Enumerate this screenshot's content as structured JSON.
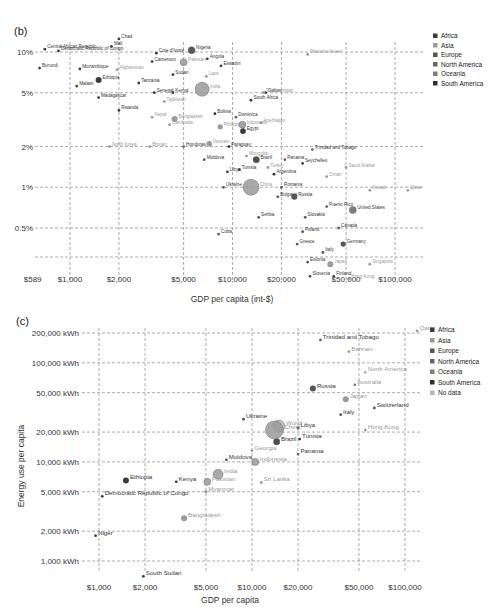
{
  "chart_data": [
    {
      "id": "b",
      "type": "scatter",
      "panel_label": "(b)",
      "title": "",
      "xlabel": "GDP per capita (int-$)",
      "ylabel": "",
      "x_scale": "log",
      "y_scale": "log",
      "x_ticks": [
        "$589",
        "$1,000",
        "$2,000",
        "$5,000",
        "$10,000",
        "$20,000",
        "$50,000",
        "$100,000"
      ],
      "y_ticks": [
        "10%",
        "5%",
        "2%",
        "1%",
        "0.5%"
      ],
      "xlim": [
        589,
        150000
      ],
      "ylim": [
        0.25,
        13
      ],
      "grid": true,
      "legend_position": "right",
      "legend": [
        "Africa",
        "Asia",
        "Europe",
        "North America",
        "Oceania",
        "South America"
      ],
      "points": [
        {
          "label": "Central African Republic",
          "gdp": 700,
          "value": 10.5,
          "region": "Africa"
        },
        {
          "label": "Democratic Republic of Congo",
          "gdp": 850,
          "value": 10.2,
          "region": "Africa"
        },
        {
          "label": "Mali",
          "gdp": 1800,
          "value": 11.0,
          "region": "Africa"
        },
        {
          "label": "Chad",
          "gdp": 2000,
          "value": 12.5,
          "region": "Africa"
        },
        {
          "label": "Cote d'Ivoire",
          "gdp": 3400,
          "value": 9.8,
          "region": "Africa"
        },
        {
          "label": "Nigeria",
          "gdp": 5600,
          "value": 10.3,
          "region": "Africa"
        },
        {
          "label": "Burundi",
          "gdp": 650,
          "value": 7.6,
          "region": "Africa"
        },
        {
          "label": "Mozambique",
          "gdp": 1150,
          "value": 7.5,
          "region": "Africa"
        },
        {
          "label": "Afghanistan",
          "gdp": 1950,
          "value": 7.4,
          "region": "Asia"
        },
        {
          "label": "Cameroon",
          "gdp": 3200,
          "value": 8.5,
          "region": "Africa"
        },
        {
          "label": "Pakistan",
          "gdp": 5000,
          "value": 8.4,
          "region": "Asia"
        },
        {
          "label": "Angola",
          "gdp": 7000,
          "value": 8.9,
          "region": "Africa"
        },
        {
          "label": "Eswatini",
          "gdp": 8500,
          "value": 7.9,
          "region": "Africa"
        },
        {
          "label": "Sudan",
          "gdp": 4300,
          "value": 6.8,
          "region": "Africa"
        },
        {
          "label": "Laos",
          "gdp": 6900,
          "value": 6.6,
          "region": "Asia"
        },
        {
          "label": "Malawi",
          "gdp": 1100,
          "value": 5.6,
          "region": "Africa"
        },
        {
          "label": "Ethiopia",
          "gdp": 1500,
          "value": 6.2,
          "region": "Africa"
        },
        {
          "label": "Tanzania",
          "gdp": 2650,
          "value": 5.9,
          "region": "Africa"
        },
        {
          "label": "India",
          "gdp": 6500,
          "value": 5.3,
          "region": "Asia"
        },
        {
          "label": "Madagascar",
          "gdp": 1500,
          "value": 4.6,
          "region": "Africa"
        },
        {
          "label": "Senegal",
          "gdp": 3300,
          "value": 5.0,
          "region": "Africa"
        },
        {
          "label": "Kenya",
          "gdp": 4300,
          "value": 5.0,
          "region": "Africa"
        },
        {
          "label": "Tajikistan",
          "gdp": 3800,
          "value": 4.3,
          "region": "Asia"
        },
        {
          "label": "Bolivia",
          "gdp": 7800,
          "value": 3.5,
          "region": "South America"
        },
        {
          "label": "South Africa",
          "gdp": 13000,
          "value": 4.4,
          "region": "Africa"
        },
        {
          "label": "Gabon",
          "gdp": 16000,
          "value": 5.0,
          "region": "Africa"
        },
        {
          "label": "Turkmenistan",
          "gdp": 15500,
          "value": 5.0,
          "region": "Asia"
        },
        {
          "label": "Palestine/Israel",
          "gdp": 29000,
          "value": 9.6,
          "region": "Asia"
        },
        {
          "label": "Rwanda",
          "gdp": 2000,
          "value": 3.7,
          "region": "Africa"
        },
        {
          "label": "Nepal",
          "gdp": 3200,
          "value": 3.3,
          "region": "Asia"
        },
        {
          "label": "Bangladesh",
          "gdp": 4400,
          "value": 3.2,
          "region": "Asia"
        },
        {
          "label": "Cambodia",
          "gdp": 4100,
          "value": 2.9,
          "region": "Asia"
        },
        {
          "label": "Dominica",
          "gdp": 10500,
          "value": 3.3,
          "region": "North America"
        },
        {
          "label": "Philippines",
          "gdp": 8400,
          "value": 2.8,
          "region": "Asia"
        },
        {
          "label": "Indonesia",
          "gdp": 11500,
          "value": 2.9,
          "region": "Asia"
        },
        {
          "label": "Azerbaijan",
          "gdp": 15000,
          "value": 3.0,
          "region": "Asia"
        },
        {
          "label": "Egypt",
          "gdp": 11600,
          "value": 2.6,
          "region": "Africa"
        },
        {
          "label": "Vietnam",
          "gdp": 7200,
          "value": 2.1,
          "region": "Asia"
        },
        {
          "label": "North Korea",
          "gdp": 1750,
          "value": 2.0,
          "region": "Asia"
        },
        {
          "label": "Bhutan",
          "gdp": 3100,
          "value": 2.0,
          "region": "Asia"
        },
        {
          "label": "Honduras",
          "gdp": 5000,
          "value": 2.0,
          "region": "North America"
        },
        {
          "label": "Paraguay",
          "gdp": 9500,
          "value": 2.0,
          "region": "South America"
        },
        {
          "label": "Mongolia",
          "gdp": 12200,
          "value": 1.7,
          "region": "Asia"
        },
        {
          "label": "Moldova",
          "gdp": 6700,
          "value": 1.6,
          "region": "Europe"
        },
        {
          "label": "Brazil",
          "gdp": 14000,
          "value": 1.6,
          "region": "South America"
        },
        {
          "label": "Panama",
          "gdp": 21000,
          "value": 1.6,
          "region": "North America"
        },
        {
          "label": "Trinidad and Tobago",
          "gdp": 31000,
          "value": 1.9,
          "region": "North America"
        },
        {
          "label": "Seychelles",
          "gdp": 27000,
          "value": 1.5,
          "region": "Africa"
        },
        {
          "label": "Saudi Arabia",
          "gdp": 50000,
          "value": 1.4,
          "region": "Asia"
        },
        {
          "label": "Libya",
          "gdp": 9300,
          "value": 1.3,
          "region": "Africa"
        },
        {
          "label": "Tunisia",
          "gdp": 11000,
          "value": 1.35,
          "region": "Africa"
        },
        {
          "label": "Turkey",
          "gdp": 16500,
          "value": 1.4,
          "region": "Asia"
        },
        {
          "label": "China",
          "gdp": 13000,
          "value": 1.0,
          "region": "Asia"
        },
        {
          "label": "Argentina",
          "gdp": 18000,
          "value": 1.25,
          "region": "South America"
        },
        {
          "label": "Oman",
          "gdp": 38000,
          "value": 1.2,
          "region": "Asia"
        },
        {
          "label": "Ukraine",
          "gdp": 8800,
          "value": 1.0,
          "region": "Europe"
        },
        {
          "label": "Romania",
          "gdp": 20000,
          "value": 1.0,
          "region": "Europe"
        },
        {
          "label": "Kuwait",
          "gdp": 70000,
          "value": 0.95,
          "region": "Asia"
        },
        {
          "label": "Qatar",
          "gdp": 120000,
          "value": 0.95,
          "region": "Asia"
        },
        {
          "label": "Bulgaria",
          "gdp": 19000,
          "value": 0.85,
          "region": "Europe"
        },
        {
          "label": "Russia",
          "gdp": 24000,
          "value": 0.85,
          "region": "Europe"
        },
        {
          "label": "Puerto Rico",
          "gdp": 38000,
          "value": 0.72,
          "region": "North America"
        },
        {
          "label": "United States",
          "gdp": 55000,
          "value": 0.68,
          "region": "North America"
        },
        {
          "label": "Serbia",
          "gdp": 14500,
          "value": 0.6,
          "region": "Europe"
        },
        {
          "label": "Slovakia",
          "gdp": 28000,
          "value": 0.6,
          "region": "Europe"
        },
        {
          "label": "Cuba",
          "gdp": 8200,
          "value": 0.45,
          "region": "North America"
        },
        {
          "label": "Canada",
          "gdp": 45000,
          "value": 0.5,
          "region": "North America"
        },
        {
          "label": "Poland",
          "gdp": 27000,
          "value": 0.47,
          "region": "Europe"
        },
        {
          "label": "Greece",
          "gdp": 25000,
          "value": 0.38,
          "region": "Europe"
        },
        {
          "label": "Germany",
          "gdp": 48000,
          "value": 0.38,
          "region": "Europe"
        },
        {
          "label": "Italy",
          "gdp": 36000,
          "value": 0.33,
          "region": "Europe"
        },
        {
          "label": "Estonia",
          "gdp": 29000,
          "value": 0.28,
          "region": "Europe"
        },
        {
          "label": "Japan",
          "gdp": 40000,
          "value": 0.27,
          "region": "Asia"
        },
        {
          "label": "Singapore",
          "gdp": 70000,
          "value": 0.27,
          "region": "Asia"
        },
        {
          "label": "Slovenia",
          "gdp": 30000,
          "value": 0.22,
          "region": "Europe"
        },
        {
          "label": "Finland",
          "gdp": 42000,
          "value": 0.22,
          "region": "Europe"
        },
        {
          "label": "Hong Kong",
          "gdp": 52000,
          "value": 0.21,
          "region": "Asia"
        }
      ]
    },
    {
      "id": "c",
      "type": "scatter",
      "panel_label": "(c)",
      "title": "",
      "xlabel": "GDP per capita",
      "ylabel": "Energy use per capita",
      "x_scale": "log",
      "y_scale": "log",
      "x_ticks": [
        "$1,000",
        "$2,000",
        "$5,000",
        "$10,000",
        "$20,000",
        "$50,000",
        "$100,000"
      ],
      "y_ticks": [
        "200,000 kWh",
        "100,000 kWh",
        "50,000 kWh",
        "20,000 kWh",
        "10,000 kWh",
        "5,000 kWh",
        "2,000 kWh",
        "1,000 kWh"
      ],
      "xlim": [
        700,
        130000
      ],
      "ylim": [
        600,
        230000
      ],
      "grid": true,
      "legend_position": "right",
      "legend": [
        "Africa",
        "Asia",
        "Europe",
        "North America",
        "Oceania",
        "South America",
        "No data"
      ],
      "points": [
        {
          "label": "Qatar",
          "gdp": 120000,
          "value": 210000,
          "region": "Asia"
        },
        {
          "label": "Trinidad and Tobago",
          "gdp": 28000,
          "value": 170000,
          "region": "North America"
        },
        {
          "label": "Bahrain",
          "gdp": 43000,
          "value": 130000,
          "region": "Asia"
        },
        {
          "label": "North America",
          "gdp": 55000,
          "value": 80000,
          "region": "No data"
        },
        {
          "label": "Russia",
          "gdp": 25000,
          "value": 55000,
          "region": "Europe"
        },
        {
          "label": "Australia",
          "gdp": 47000,
          "value": 60000,
          "region": "Oceania"
        },
        {
          "label": "Japan",
          "gdp": 41000,
          "value": 43000,
          "region": "Asia"
        },
        {
          "label": "Switzerland",
          "gdp": 63000,
          "value": 35000,
          "region": "Europe"
        },
        {
          "label": "Italy",
          "gdp": 38000,
          "value": 30000,
          "region": "Europe"
        },
        {
          "label": "Ukraine",
          "gdp": 8800,
          "value": 27000,
          "region": "Europe"
        },
        {
          "label": "World",
          "gdp": 15000,
          "value": 23000,
          "region": "No data"
        },
        {
          "label": "Libya",
          "gdp": 20000,
          "value": 22000,
          "region": "Africa"
        },
        {
          "label": "Hong Kong",
          "gdp": 55000,
          "value": 21000,
          "region": "Asia"
        },
        {
          "label": "Tunisia",
          "gdp": 20500,
          "value": 17000,
          "region": "Africa"
        },
        {
          "label": "Brazil",
          "gdp": 14500,
          "value": 16000,
          "region": "South America"
        },
        {
          "label": "China",
          "gdp": 14000,
          "value": 21000,
          "region": "Asia"
        },
        {
          "label": "Georgia",
          "gdp": 10000,
          "value": 13000,
          "region": "Asia"
        },
        {
          "label": "Panama",
          "gdp": 20000,
          "value": 12000,
          "region": "North America"
        },
        {
          "label": "Moldova",
          "gdp": 6800,
          "value": 10500,
          "region": "Europe"
        },
        {
          "label": "Indonesia",
          "gdp": 10500,
          "value": 10000,
          "region": "Asia"
        },
        {
          "label": "India",
          "gdp": 6000,
          "value": 7500,
          "region": "Asia"
        },
        {
          "label": "Pakistan",
          "gdp": 5100,
          "value": 6300,
          "region": "Asia"
        },
        {
          "label": "Myanmar",
          "gdp": 5000,
          "value": 5000,
          "region": "Asia"
        },
        {
          "label": "Sri Lanka",
          "gdp": 11500,
          "value": 6200,
          "region": "Asia"
        },
        {
          "label": "Ethiopia",
          "gdp": 1500,
          "value": 6500,
          "region": "Africa"
        },
        {
          "label": "Kenya",
          "gdp": 3200,
          "value": 6300,
          "region": "Africa"
        },
        {
          "label": "Democratic Republic of Congo",
          "gdp": 1050,
          "value": 4500,
          "region": "Africa"
        },
        {
          "label": "Bangladesh",
          "gdp": 3600,
          "value": 2700,
          "region": "Asia"
        },
        {
          "label": "Niger",
          "gdp": 950,
          "value": 1800,
          "region": "Africa"
        },
        {
          "label": "South Sudan",
          "gdp": 1950,
          "value": 700,
          "region": "Africa"
        }
      ]
    }
  ],
  "legend_colors": {
    "Africa": "#3c3c3c",
    "Asia": "#9a9a9a",
    "Europe": "#555555",
    "North America": "#666666",
    "Oceania": "#7d7d7d",
    "South America": "#2e2e2e",
    "No data": "#b5b5b5"
  }
}
